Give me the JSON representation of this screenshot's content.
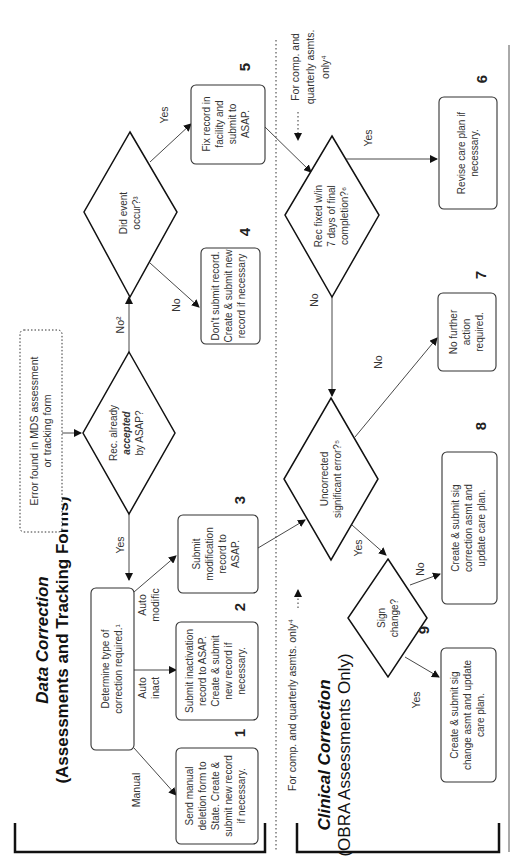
{
  "sections": {
    "data_correction": {
      "title": "Data Correction",
      "subtitle": "(Assessments and Tracking Forms)"
    },
    "clinical_correction": {
      "title": "Clinical Correction",
      "subtitle": "(OBRA Assessments Only)"
    }
  },
  "start": {
    "text_lines": [
      "Error found in MDS assessment",
      "or tracking form"
    ]
  },
  "decisions": {
    "accepted": {
      "lines": [
        "Rec. already",
        "accepted",
        "by ASAP?"
      ]
    },
    "event": {
      "lines": [
        "Did event",
        "occur?³"
      ]
    },
    "fixed7": {
      "lines": [
        "Rec fixed w/in",
        "7 days of final",
        "completion?⁶"
      ]
    },
    "uncorrected": {
      "lines": [
        "Uncorrected",
        "significant error?⁵"
      ]
    },
    "signchange": {
      "lines": [
        "Sign",
        "change?"
      ]
    }
  },
  "process": {
    "determine": {
      "lines": [
        "Determine type of",
        "correction required.¹"
      ]
    },
    "p1": {
      "number": "1",
      "lines": [
        "Send manual",
        "deletion form to",
        "State. Create &",
        "submit new record",
        "if necessary."
      ]
    },
    "p2": {
      "number": "2",
      "lines": [
        "Submit inactivation",
        "record to ASAP.",
        "Create & submit",
        "new record if",
        "necessary."
      ]
    },
    "p3": {
      "number": "3",
      "lines": [
        "Submit",
        "modification",
        "record to",
        "ASAP."
      ]
    },
    "p4": {
      "number": "4",
      "lines": [
        "Don't submit record.",
        "Create & submit new",
        "record if necessary"
      ]
    },
    "p5": {
      "number": "5",
      "lines": [
        "Fix record in",
        "facility and",
        "submit to",
        "ASAP."
      ]
    },
    "p6": {
      "number": "6",
      "lines": [
        "Revise care plan if",
        "necessary."
      ]
    },
    "p7": {
      "number": "7",
      "lines": [
        "No further",
        "action",
        "required."
      ]
    },
    "p8": {
      "number": "8",
      "lines": [
        "Create & submit sig",
        "correction asmt and",
        "update care plan."
      ]
    },
    "p9": {
      "number": "9",
      "lines": [
        "Create & submit sig",
        "change asmt and update",
        "care plan."
      ]
    }
  },
  "edge_labels": {
    "yes_accepted": "Yes",
    "no_accepted": "No²",
    "yes_event": "Yes",
    "no_event": "No",
    "manual": "Manual",
    "auto_inact": [
      "Auto",
      "inact"
    ],
    "auto_modific": [
      "Auto",
      "modific"
    ],
    "yes_fixed": "Yes",
    "no_fixed": "No",
    "no_uncorrected": "No",
    "yes_uncorrected": "Yes",
    "yes_sign": "Yes",
    "no_sign": "No"
  },
  "notes": {
    "comp_quarterly_left": "For comp. and quarterly asmts. only⁴",
    "comp_quarterly_right": [
      "For comp. and",
      "quarterly asmts.",
      "only⁴"
    ]
  }
}
